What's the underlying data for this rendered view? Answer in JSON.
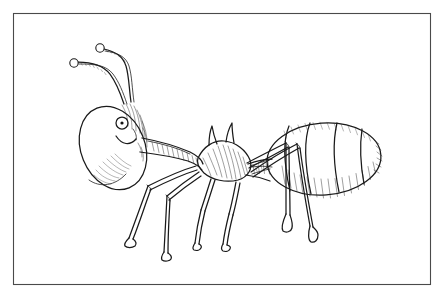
{
  "document": {
    "kind": "pen-and-ink line drawing",
    "subject": "ant",
    "title_text": "",
    "caption_text": "",
    "background_color": "#ffffff",
    "ink_color": "#1a1a1a",
    "frame_color": "#4a4a4a",
    "canvas": {
      "width": 447,
      "height": 298
    }
  },
  "frame": {
    "name": "rectangular border",
    "x": 13,
    "y": 13,
    "width": 417,
    "height": 271,
    "stroke_width": 1.1
  },
  "figure": {
    "label": "ant, side view, facing left",
    "orientation": "left-facing profile",
    "shading_style": "parallel line hatching",
    "parts": [
      {
        "name": "head",
        "shape": "tilted oval",
        "cx": 113,
        "cy": 148,
        "rx": 32,
        "ry": 43,
        "rotation_deg": -22
      },
      {
        "name": "eye",
        "shape": "circle with pupil dot",
        "cx": 122,
        "cy": 123,
        "r": 6
      },
      {
        "name": "pupil",
        "shape": "solid dot",
        "cx": 122,
        "cy": 123,
        "r": 1.6
      },
      {
        "name": "mouth",
        "shape": "smile curve"
      },
      {
        "name": "antenna-left",
        "shape": "bent filament with club tip",
        "tip_x": 72,
        "tip_y": 63
      },
      {
        "name": "antenna-right",
        "shape": "bent filament with club tip",
        "tip_x": 99,
        "tip_y": 48
      },
      {
        "name": "neck-pronotum",
        "shape": "tapered tube"
      },
      {
        "name": "thorax-mesosoma",
        "shape": "lozenge with two dorsal spines"
      },
      {
        "name": "thoracic-spine-front",
        "shape": "upward horn"
      },
      {
        "name": "thoracic-spine-rear",
        "shape": "upward horn"
      },
      {
        "name": "petiole",
        "shape": "narrow waist"
      },
      {
        "name": "abdomen-gaster",
        "shape": "large ovoid",
        "cx": 324,
        "cy": 159,
        "rx": 57,
        "ry": 36
      }
    ],
    "abdomen_segments": 4,
    "legs": {
      "count": 6,
      "structure": "double-line segments with knee joints and flared foot pads",
      "items": [
        {
          "name": "foreleg-left",
          "direction": "down-left"
        },
        {
          "name": "foreleg-right",
          "direction": "down"
        },
        {
          "name": "midleg-left",
          "direction": "down"
        },
        {
          "name": "midleg-right",
          "direction": "down"
        },
        {
          "name": "hindleg-left",
          "direction": "down-right"
        },
        {
          "name": "hindleg-right",
          "direction": "down-right"
        }
      ]
    }
  }
}
